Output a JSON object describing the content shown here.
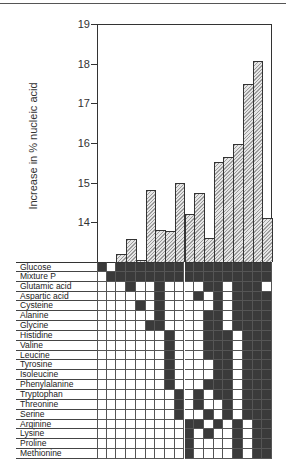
{
  "chart_data": {
    "type": "bar",
    "title": "",
    "xlabel": "",
    "ylabel": "Increase in % nucleic acid",
    "ylim": [
      13.0,
      19.0
    ],
    "yticks": [
      14,
      15,
      16,
      17,
      18,
      19
    ],
    "grid": false,
    "legend": null,
    "categories": [
      "1",
      "2",
      "3",
      "4",
      "5",
      "6",
      "7",
      "8",
      "9",
      "10",
      "11",
      "12",
      "13",
      "14",
      "15",
      "16",
      "17",
      "18"
    ],
    "values": [
      13.0,
      13.0,
      13.2,
      13.58,
      13.05,
      14.82,
      13.8,
      13.78,
      15.0,
      14.22,
      14.75,
      13.6,
      15.53,
      15.66,
      15.98,
      17.5,
      18.06,
      14.1
    ],
    "matrix": {
      "description": "Supplement combinations per bar; filled cell = component present",
      "rows": [
        {
          "label": "Glucose",
          "cells": [
            1,
            0,
            1,
            1,
            1,
            1,
            1,
            1,
            1,
            1,
            1,
            1,
            1,
            1,
            1,
            1,
            1,
            1
          ]
        },
        {
          "label": "Mixture P",
          "cells": [
            0,
            1,
            1,
            1,
            1,
            1,
            1,
            1,
            1,
            1,
            1,
            1,
            1,
            1,
            1,
            1,
            1,
            1
          ]
        },
        {
          "label": "Glutamic acid",
          "cells": [
            0,
            0,
            0,
            1,
            0,
            0,
            1,
            0,
            0,
            0,
            0,
            1,
            1,
            0,
            1,
            1,
            1,
            0
          ]
        },
        {
          "label": "Aspartic acid",
          "cells": [
            0,
            0,
            0,
            0,
            0,
            0,
            1,
            0,
            0,
            0,
            1,
            0,
            1,
            0,
            1,
            1,
            1,
            1
          ]
        },
        {
          "label": "Cysteine",
          "cells": [
            0,
            0,
            0,
            0,
            1,
            0,
            1,
            0,
            0,
            0,
            0,
            0,
            1,
            0,
            1,
            1,
            1,
            1
          ]
        },
        {
          "label": "Alanine",
          "cells": [
            0,
            0,
            0,
            0,
            0,
            0,
            1,
            0,
            0,
            0,
            0,
            1,
            1,
            0,
            1,
            1,
            1,
            1
          ]
        },
        {
          "label": "Glycine",
          "cells": [
            0,
            0,
            0,
            0,
            0,
            1,
            1,
            0,
            0,
            0,
            0,
            1,
            1,
            0,
            1,
            1,
            1,
            1
          ]
        },
        {
          "label": "Histidine",
          "cells": [
            0,
            0,
            0,
            0,
            0,
            0,
            0,
            1,
            0,
            0,
            0,
            1,
            1,
            1,
            0,
            1,
            1,
            1
          ]
        },
        {
          "label": "Valine",
          "cells": [
            0,
            0,
            0,
            0,
            0,
            0,
            0,
            1,
            0,
            0,
            0,
            1,
            1,
            1,
            0,
            1,
            1,
            1
          ]
        },
        {
          "label": "Leucine",
          "cells": [
            0,
            0,
            0,
            0,
            0,
            0,
            0,
            1,
            0,
            0,
            0,
            1,
            1,
            1,
            0,
            1,
            1,
            1
          ]
        },
        {
          "label": "Tyrosine",
          "cells": [
            0,
            0,
            0,
            0,
            0,
            0,
            0,
            1,
            0,
            0,
            0,
            0,
            1,
            1,
            0,
            1,
            1,
            1
          ]
        },
        {
          "label": "Isoleucine",
          "cells": [
            0,
            0,
            0,
            0,
            0,
            0,
            0,
            1,
            0,
            0,
            0,
            0,
            1,
            1,
            0,
            1,
            1,
            1
          ]
        },
        {
          "label": "Phenylalanine",
          "cells": [
            0,
            0,
            0,
            0,
            0,
            0,
            0,
            1,
            0,
            0,
            0,
            1,
            1,
            1,
            0,
            1,
            1,
            1
          ]
        },
        {
          "label": "Tryptophan",
          "cells": [
            0,
            0,
            0,
            0,
            0,
            0,
            0,
            0,
            1,
            0,
            1,
            0,
            1,
            1,
            0,
            1,
            1,
            1
          ]
        },
        {
          "label": "Threonine",
          "cells": [
            0,
            0,
            0,
            0,
            0,
            0,
            0,
            0,
            1,
            0,
            1,
            0,
            0,
            1,
            0,
            1,
            1,
            1
          ]
        },
        {
          "label": "Serine",
          "cells": [
            0,
            0,
            0,
            0,
            0,
            0,
            0,
            0,
            1,
            0,
            0,
            1,
            0,
            1,
            0,
            1,
            1,
            1
          ]
        },
        {
          "label": "Arginine",
          "cells": [
            0,
            0,
            0,
            0,
            0,
            0,
            0,
            0,
            0,
            1,
            1,
            0,
            1,
            0,
            1,
            0,
            1,
            1
          ]
        },
        {
          "label": "Lysine",
          "cells": [
            0,
            0,
            0,
            0,
            0,
            0,
            0,
            0,
            0,
            1,
            0,
            1,
            0,
            0,
            1,
            0,
            1,
            1
          ]
        },
        {
          "label": "Proline",
          "cells": [
            0,
            0,
            0,
            0,
            0,
            0,
            0,
            0,
            0,
            1,
            0,
            0,
            0,
            0,
            1,
            0,
            1,
            1
          ]
        },
        {
          "label": "Methionine",
          "cells": [
            0,
            0,
            0,
            0,
            0,
            0,
            0,
            0,
            0,
            1,
            0,
            0,
            0,
            0,
            1,
            0,
            1,
            1
          ]
        }
      ]
    }
  },
  "axis": {
    "y_title": "Increase in % nucleic acid",
    "tick_labels": [
      "19",
      "18",
      "17",
      "16",
      "15",
      "14"
    ]
  },
  "colors": {
    "bar_fill": "#cfcfcf",
    "bar_hatch": "#9a9a9a",
    "matrix_filled": "#3a3a3a",
    "matrix_empty": "#ffffff",
    "line": "#333333"
  }
}
